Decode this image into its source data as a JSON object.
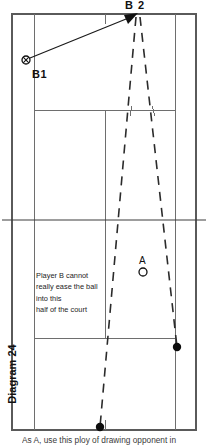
{
  "diagram": {
    "number_label": "Diagram 24",
    "caption": "As A, use this ploy of drawing opponent in",
    "annotation_lines": [
      "Player B cannot",
      "really ease the ball",
      "into this",
      "half of the court"
    ],
    "players": {
      "b1": {
        "label": "B1",
        "marker": "crossed-circle",
        "x": 26,
        "y": 60
      },
      "b2": {
        "label": "B 2",
        "marker": "arrow-target",
        "x": 137,
        "y": 15
      },
      "a": {
        "label": "A",
        "marker": "open-circle",
        "x": 143,
        "y": 272
      }
    },
    "ball_marks": [
      {
        "name": "ball-mark-right",
        "x": 177,
        "y": 347
      },
      {
        "name": "ball-mark-bottom",
        "x": 100,
        "y": 427
      }
    ],
    "colors": {
      "court_line": "#6e6e6e",
      "net_line": "#3d3d3d",
      "trajectory": "#2b2b2b",
      "marker": "#0d0d0d",
      "background": "#ffffff"
    },
    "court": {
      "type": "tennis-court-plan-view",
      "outer_left": 12,
      "outer_right": 196,
      "outer_top": 14,
      "outer_bottom": 430,
      "singles_left": 34,
      "singles_right": 175,
      "service_line_top": 110,
      "service_line_bottom": 338,
      "net_y": 220,
      "center_service_x": 105
    }
  }
}
